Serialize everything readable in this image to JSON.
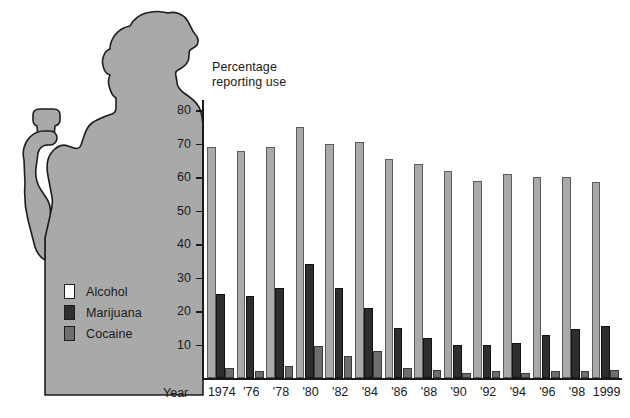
{
  "figure": {
    "axis_title_line1": "Percentage",
    "axis_title_line2": "reporting use",
    "xaxis_title": "Year",
    "artwork": "two-people-silhouette-with-cup"
  },
  "legend": {
    "position": "inside-left",
    "items": [
      {
        "label": "Alcohol",
        "color": "#a9a9a9",
        "key": "alcohol"
      },
      {
        "label": "Marijuana",
        "color": "#2e2e2e",
        "key": "marijuana"
      },
      {
        "label": "Cocaine",
        "color": "#6e6e6e",
        "key": "cocaine"
      }
    ]
  },
  "colors": {
    "alcohol": "#a9a9a9",
    "marijuana": "#2e2e2e",
    "cocaine": "#6e6e6e",
    "silhouette_fill": "#a9a9a9",
    "silhouette_stroke": "#1d1d1d",
    "axis": "#1a1a1a",
    "background": "#ffffff"
  },
  "chart_data": {
    "type": "bar",
    "title": "Percentage reporting use",
    "xlabel": "Year",
    "ylabel": "Percentage reporting use",
    "ylim": [
      0,
      85
    ],
    "yticks": [
      10,
      20,
      30,
      40,
      50,
      60,
      70,
      80
    ],
    "grid": false,
    "legend_position": "inside-left",
    "categories": [
      "1974",
      "'76",
      "'78",
      "'80",
      "'82",
      "'84",
      "'86",
      "'88",
      "'90",
      "'92",
      "'94",
      "'96",
      "'98",
      "1999"
    ],
    "series": [
      {
        "name": "Alcohol",
        "color": "#a9a9a9",
        "values": [
          69,
          68,
          69,
          75,
          70,
          70.5,
          65.5,
          64,
          62,
          59,
          61,
          60,
          60,
          58.5
        ]
      },
      {
        "name": "Marijuana",
        "color": "#2e2e2e",
        "values": [
          25,
          24.5,
          27,
          34,
          27,
          21,
          15,
          12,
          10,
          10,
          10.5,
          13,
          14.5,
          15.5
        ]
      },
      {
        "name": "Cocaine",
        "color": "#6e6e6e",
        "values": [
          3,
          2,
          3.5,
          9.5,
          6.5,
          8,
          3,
          2.5,
          1.5,
          2,
          1.5,
          2,
          2,
          2.5
        ]
      }
    ]
  }
}
